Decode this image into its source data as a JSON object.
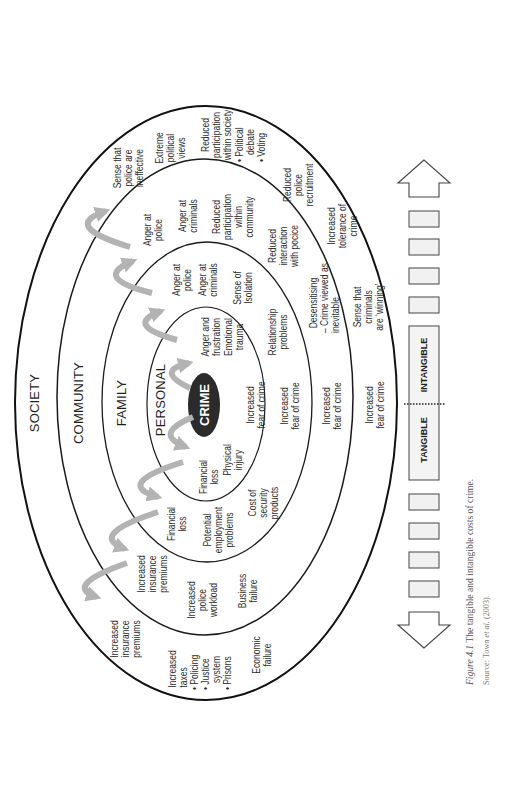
{
  "figure": {
    "ring_titles": {
      "society": "SOCIETY",
      "community": "COMMUNITY",
      "family": "FAMILY",
      "personal": "PERSONAL"
    },
    "center_label": "CRIME",
    "personal_costs": [
      "Financial\nloss",
      "Physical\ninjury",
      "Increased\nfear of crime",
      "Anger and\nfrustration",
      "Emotional\ntrauma"
    ],
    "family_costs": [
      "Financial\nloss",
      "Potential\nemployment\nproblems",
      "Cost of\nsecurity\nproducts",
      "Increased\nfear of crime",
      "Relationship\nproblems",
      "Anger at\npolice",
      "Anger at\ncriminals",
      "Sense of\nIsolation"
    ],
    "community_costs": [
      "Increased\ninsurance\npremiums",
      "Increased\npolice\nworkload",
      "Business\nfailure",
      "Increased\nfear of crime",
      "  Desensitising\n– Crime viewed as\ninevitable",
      "Reduced\ninteraction\nwith pocice",
      "Anger at\npolice",
      "Anger at\ncriminals",
      "Reduced\nparticipation\nwithin\ncommunity"
    ],
    "society_costs": [
      "Increased\ninsurance\npremiums",
      " Increased\n taxes\n• Policing\n• Justice\n   system\n• Prisons",
      "Economic\nfailure",
      "Increased\nfear of crime",
      "Sense that\ncriminals\nare ‘winning’",
      "Increased\ntolerance of\ncrime",
      "Reduced\npolice\nrecruitment",
      "Sense that\npolice are\nineffective",
      "Extreme\npolitical\nviews",
      "Reduced\nparticipation\nwithin society",
      "• Political\n   debate\n• Voting"
    ],
    "cost_scale": {
      "tangible": "TANGIBLE",
      "intangible": "INTANGIBLE",
      "left_icon": "arrow-left-icon",
      "right_icon": "arrow-right-icon"
    }
  },
  "caption": {
    "figure_number": "Figure 4.1",
    "title": " The tangible and intangible costs of crime.",
    "source_prefix": "Source: Town ",
    "source_italic": "et al.",
    "source_suffix": " (2003)."
  },
  "colors": {
    "ring_stroke": "#1a1a1a",
    "center_fill": "#2b2b2b",
    "flow_arrow": "#b3b3b3",
    "text": "#2e2e2e",
    "box_fill": "#f1f1f1",
    "box_stroke": "#555555"
  }
}
